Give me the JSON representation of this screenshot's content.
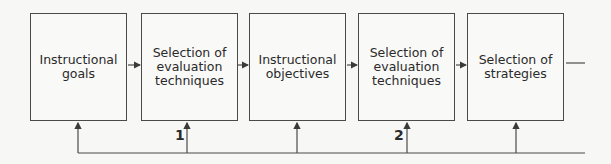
{
  "diagram": {
    "type": "flowchart",
    "boxes": [
      {
        "id": "instructional-goals",
        "label": "Instructional\ngoals"
      },
      {
        "id": "evaluation-techniques-1",
        "label": "Selection of\nevaluation\ntechniques"
      },
      {
        "id": "instructional-objectives",
        "label": "Instructional\nobjectives"
      },
      {
        "id": "evaluation-techniques-2",
        "label": "Selection of\nevaluation\ntechniques"
      },
      {
        "id": "selection-of-strategies",
        "label": "Selection of\nstrategies"
      }
    ],
    "feedback_labels": {
      "first": "1",
      "second": "2"
    },
    "line_color": "#4a4a4a"
  }
}
